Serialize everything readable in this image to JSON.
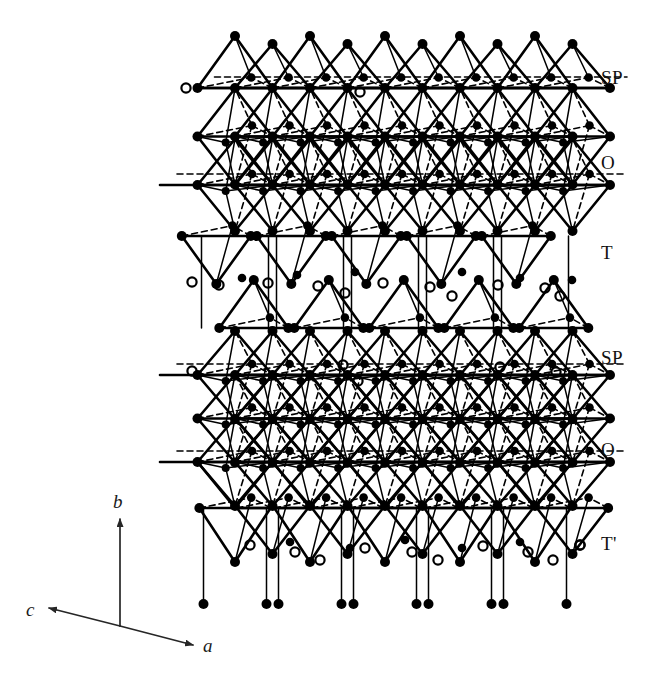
{
  "figure": {
    "background_color": "#ffffff",
    "ink_color": "#000000",
    "width": 654,
    "height": 673
  },
  "layer_labels": [
    {
      "text": "SP",
      "x": 601,
      "y": 68
    },
    {
      "text": "O",
      "x": 601,
      "y": 153
    },
    {
      "text": "T",
      "x": 601,
      "y": 243
    },
    {
      "text": "SP",
      "x": 601,
      "y": 348
    },
    {
      "text": "O",
      "x": 601,
      "y": 440
    },
    {
      "text": "T'",
      "x": 601,
      "y": 534
    }
  ],
  "axes": {
    "origin": {
      "x": 120,
      "y": 626
    },
    "vectors": [
      {
        "label": "b",
        "tip_x": 120,
        "tip_y": 519,
        "label_x": 113,
        "label_y": 492
      },
      {
        "label": "c",
        "tip_x": 49,
        "tip_y": 608,
        "label_x": 26,
        "label_y": 600
      },
      {
        "label": "a",
        "tip_x": 193,
        "tip_y": 645,
        "label_x": 203,
        "label_y": 636
      }
    ]
  },
  "chart_data": {
    "type": "diagram",
    "legend": {
      "filled_circle": "cation / framework atom (solid black disc)",
      "open_circle": "interstitial or partially-occupied site (hollow ring)",
      "solid_line": "polyhedron edge in front",
      "dashed_line": "polyhedron edge behind (hidden)"
    },
    "layer_sequence": [
      "SP",
      "O",
      "T",
      "SP",
      "O",
      "T'"
    ],
    "layer_y_positions": [
      88,
      185,
      282,
      375,
      462,
      556
    ],
    "column_count": 5,
    "column_x_positions": [
      235,
      310,
      385,
      460,
      535
    ],
    "column_spacing": 75,
    "axis_triad": [
      "a",
      "b",
      "c"
    ],
    "margin_open_circles": [
      {
        "x": 186,
        "y": 88
      },
      {
        "x": 192,
        "y": 282
      },
      {
        "x": 219,
        "y": 285
      },
      {
        "x": 192,
        "y": 371
      },
      {
        "x": 580,
        "y": 545
      }
    ]
  }
}
